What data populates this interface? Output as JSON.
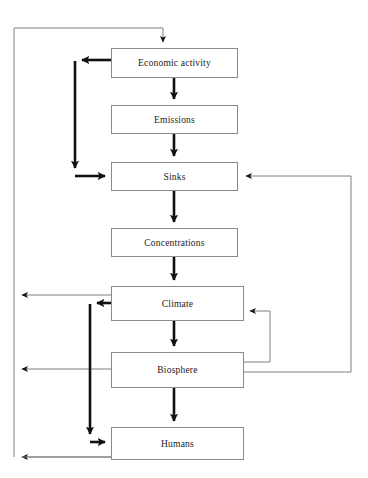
{
  "diagram": {
    "width": 368,
    "height": 478,
    "background_color": "#ffffff",
    "box_border_color": "#8a8a8a",
    "thin_edge_color": "#808080",
    "bold_edge_color": "#111111",
    "text_color": "#1a1a1a",
    "nodes": [
      {
        "id": "economic-activity",
        "label": "Economic activity",
        "x": 111,
        "y": 48,
        "width": 127,
        "height": 30
      },
      {
        "id": "emissions",
        "label": "Emissions",
        "x": 111,
        "y": 105,
        "width": 127,
        "height": 29
      },
      {
        "id": "sinks",
        "label": "Sinks",
        "x": 111,
        "y": 162,
        "width": 127,
        "height": 29
      },
      {
        "id": "concentrations",
        "label": "Concentrations",
        "x": 111,
        "y": 228,
        "width": 127,
        "height": 29
      },
      {
        "id": "climate",
        "label": "Climate",
        "x": 111,
        "y": 286,
        "width": 133,
        "height": 35
      },
      {
        "id": "biosphere",
        "label": "Biosphere",
        "x": 111,
        "y": 352,
        "width": 133,
        "height": 36
      },
      {
        "id": "humans",
        "label": "Humans",
        "x": 111,
        "y": 427,
        "width": 133,
        "height": 33
      }
    ],
    "edges": [
      {
        "id": "economic-activity-to-emissions",
        "from": "economic-activity",
        "to": "emissions",
        "weight": "bold"
      },
      {
        "id": "emissions-to-sinks",
        "from": "emissions",
        "to": "sinks",
        "weight": "bold"
      },
      {
        "id": "sinks-to-concentrations",
        "from": "sinks",
        "to": "concentrations",
        "weight": "bold"
      },
      {
        "id": "concentrations-to-climate",
        "from": "concentrations",
        "to": "climate",
        "weight": "bold"
      },
      {
        "id": "climate-to-biosphere",
        "from": "climate",
        "to": "biosphere",
        "weight": "bold"
      },
      {
        "id": "biosphere-to-humans",
        "from": "biosphere",
        "to": "humans",
        "weight": "bold"
      },
      {
        "id": "economic-activity-to-sinks-feedback",
        "from": "economic-activity",
        "to": "sinks",
        "weight": "bold"
      },
      {
        "id": "climate-to-humans-feedback",
        "from": "climate",
        "to": "humans",
        "weight": "bold"
      },
      {
        "id": "climate-to-outer-left",
        "from": "climate",
        "to": "economic-activity",
        "weight": "thin"
      },
      {
        "id": "biosphere-to-outer-left",
        "from": "biosphere",
        "to": "economic-activity",
        "weight": "thin"
      },
      {
        "id": "humans-to-outer-left",
        "from": "humans",
        "to": "economic-activity",
        "weight": "thin"
      },
      {
        "id": "biosphere-to-sinks",
        "from": "biosphere",
        "to": "sinks",
        "weight": "thin"
      },
      {
        "id": "biosphere-to-climate",
        "from": "biosphere",
        "to": "climate",
        "weight": "thin"
      }
    ]
  }
}
